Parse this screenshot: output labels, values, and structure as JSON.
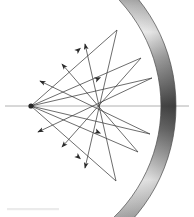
{
  "figure": {
    "background_color": "#ffffff",
    "width": 194,
    "height": 217
  },
  "colors": {
    "ray": "#3c3c3c",
    "arrow": "#2a2a2a",
    "axis": "#b0b0b0",
    "mirror_light": "#f2f2f2",
    "mirror_mid": "#9a9a9a",
    "mirror_dark": "#4e4e4e",
    "mirror_outline": "#4a4a4a",
    "source": "#272727",
    "caption_smudge": "#ebebeb"
  },
  "optical_axis": {
    "label": "optical-axis",
    "x_start": 5,
    "x_end": 189,
    "y": 106,
    "stroke_width": 1
  },
  "source_point": {
    "label": "point-source",
    "x": 31,
    "y": 106,
    "radius": 2.6
  },
  "mirror": {
    "label": "concave-spherical-mirror",
    "type": "thick-arc",
    "center_x": 6,
    "center_y": 106,
    "inner_radius": 155,
    "outer_radius": 170,
    "start_angle_deg": -57,
    "end_angle_deg": 57,
    "vertex_x": 161,
    "vertex_y": 106,
    "shading": "gradient-banded",
    "gradient_stops": [
      {
        "offset": "0%",
        "color": "#5a5a5a"
      },
      {
        "offset": "14%",
        "color": "#8e8e8e"
      },
      {
        "offset": "26%",
        "color": "#f4f4f4"
      },
      {
        "offset": "40%",
        "color": "#8a8a8a"
      },
      {
        "offset": "52%",
        "color": "#4e4e4e"
      },
      {
        "offset": "64%",
        "color": "#9d9d9d"
      },
      {
        "offset": "78%",
        "color": "#efefef"
      },
      {
        "offset": "90%",
        "color": "#8b8b8b"
      },
      {
        "offset": "100%",
        "color": "#5e5e5e"
      }
    ]
  },
  "chart_data": {
    "type": "diagram",
    "xlabel": "",
    "ylabel": "",
    "source": {
      "x": 31,
      "y": 106
    },
    "mirror_arc": {
      "cx": 6,
      "cy": 106,
      "r_inner": 155,
      "r_outer": 170,
      "theta_min_deg": -57,
      "theta_max_deg": 57
    },
    "incident_rays": [
      {
        "id": "i1",
        "from": [
          31,
          106
        ],
        "to": [
          117,
          30
        ],
        "angle_deg": -41.5
      },
      {
        "id": "i2",
        "from": [
          31,
          106
        ],
        "to": [
          141,
          58
        ],
        "angle_deg": -23.6
      },
      {
        "id": "i3",
        "from": [
          31,
          106
        ],
        "to": [
          152,
          78
        ],
        "angle_deg": -13.0
      },
      {
        "id": "i4",
        "from": [
          31,
          106
        ],
        "to": [
          150,
          134
        ],
        "angle_deg": 13.2
      },
      {
        "id": "i5",
        "from": [
          31,
          106
        ],
        "to": [
          138,
          152
        ],
        "angle_deg": 23.3
      },
      {
        "id": "i6",
        "from": [
          31,
          106
        ],
        "to": [
          116,
          181
        ],
        "angle_deg": 41.4
      }
    ],
    "reflected_rays": [
      {
        "id": "r1",
        "from": [
          117,
          30
        ],
        "to": [
          85,
          168
        ],
        "crosses_axis_at_x": 104
      },
      {
        "id": "r2",
        "from": [
          141,
          58
        ],
        "to": [
          62,
          147
        ],
        "crosses_axis_at_x": 98
      },
      {
        "id": "r3",
        "from": [
          152,
          78
        ],
        "to": [
          38,
          132
        ],
        "crosses_axis_at_x": 96
      },
      {
        "id": "r4",
        "from": [
          150,
          134
        ],
        "to": [
          40,
          81
        ],
        "crosses_axis_at_x": 97
      },
      {
        "id": "r5",
        "from": [
          138,
          152
        ],
        "to": [
          62,
          64
        ],
        "crosses_axis_at_x": 98
      },
      {
        "id": "r6",
        "from": [
          116,
          181
        ],
        "to": [
          85,
          44
        ],
        "crosses_axis_at_x": 104
      }
    ],
    "arrowheads": [
      {
        "id": "a1",
        "x": 85,
        "y": 168,
        "direction_deg": 103
      },
      {
        "id": "a2",
        "x": 62,
        "y": 147,
        "direction_deg": 131
      },
      {
        "id": "a3",
        "x": 38,
        "y": 132,
        "direction_deg": 155
      },
      {
        "id": "a4",
        "x": 40,
        "y": 81,
        "direction_deg": 205
      },
      {
        "id": "a5",
        "x": 62,
        "y": 64,
        "direction_deg": 229
      },
      {
        "id": "a6",
        "x": 85,
        "y": 44,
        "direction_deg": 257
      },
      {
        "id": "a7",
        "x": 76,
        "y": 155,
        "direction_deg": 62
      },
      {
        "id": "a8",
        "x": 95,
        "y": 130,
        "direction_deg": 25
      },
      {
        "id": "a9",
        "x": 93,
        "y": 80,
        "direction_deg": -25
      },
      {
        "id": "a10",
        "x": 76,
        "y": 52,
        "direction_deg": -62
      }
    ]
  }
}
